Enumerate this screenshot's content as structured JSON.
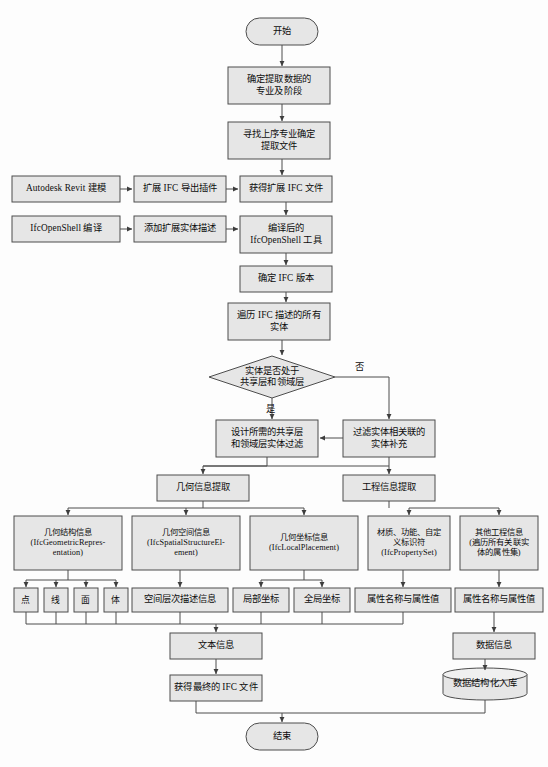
{
  "diagram": {
    "style": {
      "node_fill": "#e6e6e6",
      "node_stroke": "#4d4d4d",
      "edge_stroke": "#4d4d4d",
      "background": "#fdfdfd",
      "text_color": "#0d0d0d"
    },
    "nodes": [
      {
        "id": "start",
        "shape": "terminator",
        "label": "开始",
        "x": 246,
        "y": 18,
        "w": 72,
        "h": 27
      },
      {
        "id": "scope",
        "shape": "process",
        "label": "确定提取数据的\n专业及阶段",
        "x": 228,
        "y": 67,
        "w": 102,
        "h": 37
      },
      {
        "id": "upstream",
        "shape": "process",
        "label": "寻找上序专业确定\n提取文件",
        "x": 228,
        "y": 122,
        "w": 102,
        "h": 37
      },
      {
        "id": "revit",
        "shape": "process",
        "label": "Autodesk Revit 建模",
        "x": 12,
        "y": 176,
        "w": 108,
        "h": 26
      },
      {
        "id": "plugin",
        "shape": "process",
        "label": "扩展 IFC 导出插件",
        "x": 134,
        "y": 176,
        "w": 92,
        "h": 26
      },
      {
        "id": "ifcfile",
        "shape": "process",
        "label": "获得扩展 IFC 文件",
        "x": 240,
        "y": 176,
        "w": 92,
        "h": 26
      },
      {
        "id": "ifcopenshell",
        "shape": "process",
        "label": "IfcOpenShell 编译",
        "x": 12,
        "y": 216,
        "w": 108,
        "h": 26
      },
      {
        "id": "entitydesc",
        "shape": "process",
        "label": "添加扩展实体描述",
        "x": 134,
        "y": 216,
        "w": 92,
        "h": 26
      },
      {
        "id": "tool",
        "shape": "process",
        "label": "编译后的\nIfcOpenShell 工具",
        "x": 240,
        "y": 216,
        "w": 92,
        "h": 37
      },
      {
        "id": "version",
        "shape": "process",
        "label": "确定 IFC 版本",
        "x": 240,
        "y": 266,
        "w": 92,
        "h": 26
      },
      {
        "id": "traverse",
        "shape": "process",
        "label": "遍历 IFC 描述的所有\n实体",
        "x": 228,
        "y": 303,
        "w": 102,
        "h": 37
      },
      {
        "id": "decision",
        "shape": "decision",
        "label": "实体是否处于\n共享层和领域层",
        "x": 209,
        "y": 356,
        "w": 126,
        "h": 42
      },
      {
        "id": "filter",
        "shape": "process",
        "label": "设计所需的共享层\n和领域层实体过滤",
        "x": 216,
        "y": 420,
        "w": 102,
        "h": 37
      },
      {
        "id": "supplement",
        "shape": "process",
        "label": "过滤实体相关联的\n实体补充",
        "x": 343,
        "y": 420,
        "w": 92,
        "h": 37
      },
      {
        "id": "geoinfo",
        "shape": "process",
        "label": "几何信息提取",
        "x": 157,
        "y": 475,
        "w": 92,
        "h": 26
      },
      {
        "id": "enginfo",
        "shape": "process",
        "label": "工程信息提取",
        "x": 343,
        "y": 475,
        "w": 92,
        "h": 26
      },
      {
        "id": "geostruct",
        "shape": "process",
        "label": "几何结构信息\n(IfcGeometricRepres-\nentation)",
        "x": 14,
        "y": 516,
        "w": 108,
        "h": 54
      },
      {
        "id": "geospatial",
        "shape": "process",
        "label": "几何空间信息\n(IfcSpatialStructureEl-\nement)",
        "x": 132,
        "y": 516,
        "w": 108,
        "h": 54
      },
      {
        "id": "geocoord",
        "shape": "process",
        "label": "几何坐标信息\n(IfcLocalPlacement)",
        "x": 250,
        "y": 516,
        "w": 108,
        "h": 54
      },
      {
        "id": "propset",
        "shape": "process",
        "label": "材质、功能、自定\n义标识符\n(IfcPropertySet)",
        "x": 368,
        "y": 516,
        "w": 82,
        "h": 54
      },
      {
        "id": "otherinfo",
        "shape": "process",
        "label": "其他工程信息\n(遍历所有关联实\n体的属性集)",
        "x": 460,
        "y": 516,
        "w": 78,
        "h": 54
      },
      {
        "id": "point",
        "shape": "process",
        "label": "点",
        "x": 14,
        "y": 588,
        "w": 24,
        "h": 24
      },
      {
        "id": "line",
        "shape": "process",
        "label": "线",
        "x": 44,
        "y": 588,
        "w": 24,
        "h": 24
      },
      {
        "id": "face",
        "shape": "process",
        "label": "面",
        "x": 74,
        "y": 588,
        "w": 24,
        "h": 24
      },
      {
        "id": "solid",
        "shape": "process",
        "label": "体",
        "x": 104,
        "y": 588,
        "w": 24,
        "h": 24
      },
      {
        "id": "spatiallevel",
        "shape": "process",
        "label": "空间层次描述信息",
        "x": 132,
        "y": 588,
        "w": 96,
        "h": 24
      },
      {
        "id": "localcoord",
        "shape": "process",
        "label": "局部坐标",
        "x": 233,
        "y": 588,
        "w": 56,
        "h": 24
      },
      {
        "id": "globalcoord",
        "shape": "process",
        "label": "全局坐标",
        "x": 294,
        "y": 588,
        "w": 56,
        "h": 24
      },
      {
        "id": "propval1",
        "shape": "process",
        "label": "属性名称与属性值",
        "x": 355,
        "y": 588,
        "w": 96,
        "h": 24
      },
      {
        "id": "propval2",
        "shape": "process",
        "label": "属性名称与属性值",
        "x": 455,
        "y": 588,
        "w": 88,
        "h": 24
      },
      {
        "id": "textinfo",
        "shape": "process",
        "label": "文本信息",
        "x": 170,
        "y": 633,
        "w": 92,
        "h": 26
      },
      {
        "id": "datainfo",
        "shape": "process",
        "label": "数据信息",
        "x": 453,
        "y": 633,
        "w": 82,
        "h": 26
      },
      {
        "id": "finalifc",
        "shape": "process",
        "label": "获得最终的 IFC 文件",
        "x": 170,
        "y": 675,
        "w": 92,
        "h": 26
      },
      {
        "id": "database",
        "shape": "cylinder",
        "label": "数据结构化入库",
        "x": 443,
        "y": 668,
        "w": 84,
        "h": 32
      },
      {
        "id": "end",
        "shape": "terminator",
        "label": "结束",
        "x": 246,
        "y": 723,
        "w": 72,
        "h": 27
      }
    ],
    "edge_labels": [
      {
        "id": "no-branch",
        "text": "否",
        "x": 355,
        "y": 359
      },
      {
        "id": "yes-branch",
        "text": "是",
        "x": 266,
        "y": 401
      }
    ]
  }
}
